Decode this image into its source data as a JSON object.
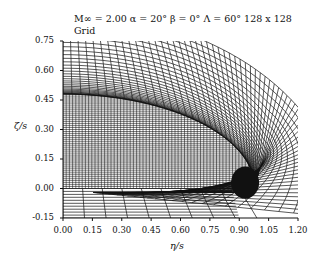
{
  "chart_data": {
    "type": "mesh",
    "title": "M∞ = 2.00  α = 20°  β = 0°  Λ = 60°  128 x 128",
    "subtitle": "Grid",
    "xlabel": "η/s",
    "ylabel": "ζ/s",
    "xlim": [
      0.0,
      1.2
    ],
    "ylim": [
      -0.15,
      0.75
    ],
    "xticks": [
      "0.00",
      "0.15",
      "0.30",
      "0.45",
      "0.60",
      "0.75",
      "0.90",
      "1.05",
      "1.20"
    ],
    "yticks": [
      "0.75",
      "0.60",
      "0.45",
      "0.30",
      "0.15",
      "0.00",
      "-0.15"
    ],
    "grid_resolution": "128 x 128",
    "body": {
      "semi_span": 1.0,
      "max_height": 0.48,
      "shape": "conical cross-section, dense grid clustering near body surface"
    },
    "grid_on": false,
    "legend": null
  },
  "plot": {
    "line_color": "#111111",
    "background": "#ffffff"
  }
}
